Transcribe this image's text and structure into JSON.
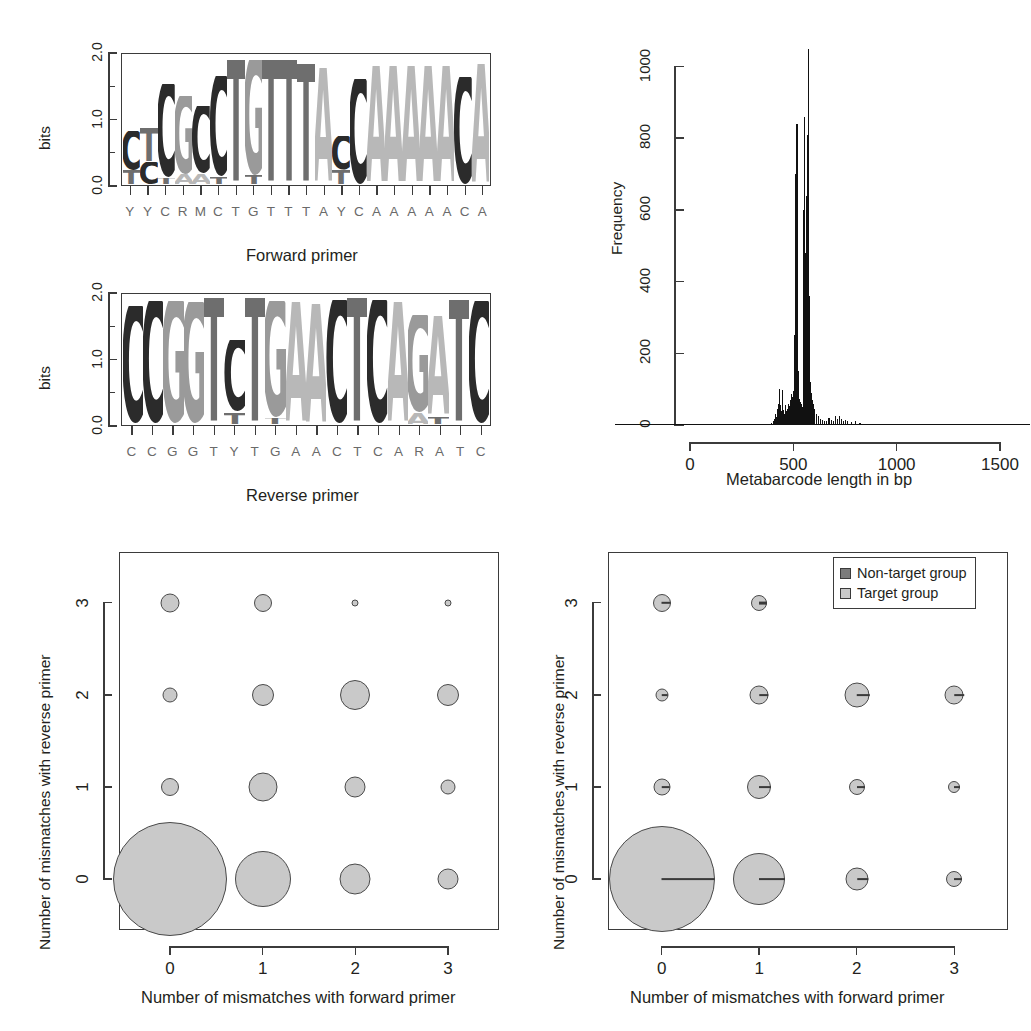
{
  "figure": {
    "background": "#ffffff",
    "colors": {
      "axis": "#3b3b3b",
      "text": "#231f20",
      "seq_label": "#6a6a6a",
      "hist_bar": "#111111",
      "target_fill": "#c9c9c9",
      "target_stroke": "#4a4a4a",
      "nontarget_fill": "#7b7b7b",
      "nontarget_stroke": "#3a3a3a",
      "base_A": "#b8b8b8",
      "base_C": "#2b2b2b",
      "base_G": "#9a9a9a",
      "base_T": "#6e6e6e"
    }
  },
  "chart_data": [
    {
      "id": "forward-primer-logo",
      "type": "bar",
      "title": "Forward primer",
      "xlabel": "",
      "ylabel": "bits",
      "ylim": [
        0,
        2
      ],
      "yticks": [
        "0.0",
        "1.0",
        "2.0"
      ],
      "grid": false,
      "consensus": [
        "Y",
        "Y",
        "C",
        "R",
        "M",
        "C",
        "T",
        "G",
        "T",
        "T",
        "T",
        "A",
        "Y",
        "C",
        "A",
        "A",
        "A",
        "A",
        "A",
        "C",
        "A"
      ],
      "categories": [
        "1",
        "2",
        "3",
        "4",
        "5",
        "6",
        "7",
        "8",
        "9",
        "10",
        "11",
        "12",
        "13",
        "14",
        "15",
        "16",
        "17",
        "18",
        "19",
        "20",
        "21"
      ],
      "stacks": [
        [
          {
            "base": "T",
            "bits": 0.22
          },
          {
            "base": "C",
            "bits": 0.6
          }
        ],
        [
          {
            "base": "C",
            "bits": 0.35
          },
          {
            "base": "T",
            "bits": 0.52
          }
        ],
        [
          {
            "base": "T",
            "bits": 0.1
          },
          {
            "base": "C",
            "bits": 1.45
          }
        ],
        [
          {
            "base": "A",
            "bits": 0.16
          },
          {
            "base": "G",
            "bits": 1.2
          }
        ],
        [
          {
            "base": "A",
            "bits": 0.16
          },
          {
            "base": "C",
            "bits": 1.05
          }
        ],
        [
          {
            "base": "T",
            "bits": 0.12
          },
          {
            "base": "C",
            "bits": 1.55
          }
        ],
        [
          {
            "base": "T",
            "bits": 1.92
          }
        ],
        [
          {
            "base": "T",
            "bits": 0.14
          },
          {
            "base": "G",
            "bits": 1.78
          }
        ],
        [
          {
            "base": "T",
            "bits": 1.92
          }
        ],
        [
          {
            "base": "T",
            "bits": 1.92
          }
        ],
        [
          {
            "base": "T",
            "bits": 1.86
          }
        ],
        [
          {
            "base": "A",
            "bits": 1.8
          }
        ],
        [
          {
            "base": "T",
            "bits": 0.22
          },
          {
            "base": "C",
            "bits": 0.52
          }
        ],
        [
          {
            "base": "C",
            "bits": 1.62
          }
        ],
        [
          {
            "base": "A",
            "bits": 1.82
          }
        ],
        [
          {
            "base": "A",
            "bits": 1.82
          }
        ],
        [
          {
            "base": "A",
            "bits": 1.82
          }
        ],
        [
          {
            "base": "A",
            "bits": 1.82
          }
        ],
        [
          {
            "base": "A",
            "bits": 1.82
          }
        ],
        [
          {
            "base": "C",
            "bits": 1.66
          }
        ],
        [
          {
            "base": "A",
            "bits": 1.86
          }
        ]
      ]
    },
    {
      "id": "reverse-primer-logo",
      "type": "bar",
      "title": "Reverse primer",
      "xlabel": "",
      "ylabel": "bits",
      "ylim": [
        0,
        2
      ],
      "yticks": [
        "0.0",
        "1.0",
        "2.0"
      ],
      "grid": false,
      "consensus": [
        "C",
        "C",
        "G",
        "G",
        "T",
        "Y",
        "T",
        "G",
        "A",
        "A",
        "C",
        "T",
        "C",
        "A",
        "R",
        "A",
        "T",
        "C"
      ],
      "categories": [
        "1",
        "2",
        "3",
        "4",
        "5",
        "6",
        "7",
        "8",
        "9",
        "10",
        "11",
        "12",
        "13",
        "14",
        "15",
        "16",
        "17",
        "18"
      ],
      "stacks": [
        [
          {
            "base": "C",
            "bits": 1.82
          }
        ],
        [
          {
            "base": "C",
            "bits": 1.9
          }
        ],
        [
          {
            "base": "G",
            "bits": 1.9
          }
        ],
        [
          {
            "base": "G",
            "bits": 1.88
          }
        ],
        [
          {
            "base": "T",
            "bits": 1.95
          }
        ],
        [
          {
            "base": "T",
            "bits": 0.18
          },
          {
            "base": "C",
            "bits": 1.12
          }
        ],
        [
          {
            "base": "T",
            "bits": 1.95
          }
        ],
        [
          {
            "base": "T",
            "bits": 0.1
          },
          {
            "base": "G",
            "bits": 1.8
          }
        ],
        [
          {
            "base": "A",
            "bits": 1.88
          }
        ],
        [
          {
            "base": "A",
            "bits": 1.86
          }
        ],
        [
          {
            "base": "C",
            "bits": 1.92
          }
        ],
        [
          {
            "base": "T",
            "bits": 1.95
          }
        ],
        [
          {
            "base": "C",
            "bits": 1.92
          }
        ],
        [
          {
            "base": "A",
            "bits": 1.88
          }
        ],
        [
          {
            "base": "A",
            "bits": 0.18
          },
          {
            "base": "G",
            "bits": 1.5
          }
        ],
        [
          {
            "base": "T",
            "bits": 0.12
          },
          {
            "base": "A",
            "bits": 1.55
          }
        ],
        [
          {
            "base": "T",
            "bits": 1.92
          }
        ],
        [
          {
            "base": "C",
            "bits": 1.9
          }
        ]
      ]
    },
    {
      "id": "metabarcode-length-histogram",
      "type": "bar",
      "title": "",
      "xlabel": "Metabarcode length in bp",
      "ylabel": "Frequency",
      "xlim": [
        0,
        1500
      ],
      "ylim": [
        0,
        1060
      ],
      "xticks": [
        "0",
        "500",
        "1000",
        "1500"
      ],
      "yticks": [
        "0",
        "200",
        "400",
        "600",
        "800",
        "1000"
      ],
      "grid": false,
      "bin_width_bp": 5,
      "bins": [
        {
          "bp": 300,
          "count": 2
        },
        {
          "bp": 320,
          "count": 2
        },
        {
          "bp": 345,
          "count": 3
        },
        {
          "bp": 360,
          "count": 2
        },
        {
          "bp": 375,
          "count": 4
        },
        {
          "bp": 390,
          "count": 6
        },
        {
          "bp": 400,
          "count": 12
        },
        {
          "bp": 405,
          "count": 18
        },
        {
          "bp": 410,
          "count": 30
        },
        {
          "bp": 415,
          "count": 22
        },
        {
          "bp": 420,
          "count": 45
        },
        {
          "bp": 425,
          "count": 60
        },
        {
          "bp": 430,
          "count": 100
        },
        {
          "bp": 435,
          "count": 55
        },
        {
          "bp": 440,
          "count": 38
        },
        {
          "bp": 445,
          "count": 98
        },
        {
          "bp": 450,
          "count": 42
        },
        {
          "bp": 455,
          "count": 30
        },
        {
          "bp": 460,
          "count": 55
        },
        {
          "bp": 465,
          "count": 38
        },
        {
          "bp": 470,
          "count": 46
        },
        {
          "bp": 475,
          "count": 60
        },
        {
          "bp": 480,
          "count": 52
        },
        {
          "bp": 485,
          "count": 70
        },
        {
          "bp": 490,
          "count": 86
        },
        {
          "bp": 495,
          "count": 78
        },
        {
          "bp": 500,
          "count": 96
        },
        {
          "bp": 505,
          "count": 250
        },
        {
          "bp": 510,
          "count": 700
        },
        {
          "bp": 515,
          "count": 840
        },
        {
          "bp": 520,
          "count": 150
        },
        {
          "bp": 525,
          "count": 72
        },
        {
          "bp": 530,
          "count": 64
        },
        {
          "bp": 535,
          "count": 58
        },
        {
          "bp": 540,
          "count": 50
        },
        {
          "bp": 545,
          "count": 600
        },
        {
          "bp": 550,
          "count": 860
        },
        {
          "bp": 555,
          "count": 480
        },
        {
          "bp": 560,
          "count": 640
        },
        {
          "bp": 565,
          "count": 810
        },
        {
          "bp": 570,
          "count": 1050
        },
        {
          "bp": 575,
          "count": 360
        },
        {
          "bp": 580,
          "count": 120
        },
        {
          "bp": 585,
          "count": 90
        },
        {
          "bp": 590,
          "count": 70
        },
        {
          "bp": 595,
          "count": 58
        },
        {
          "bp": 600,
          "count": 44
        },
        {
          "bp": 610,
          "count": 32
        },
        {
          "bp": 620,
          "count": 24
        },
        {
          "bp": 630,
          "count": 18
        },
        {
          "bp": 640,
          "count": 14
        },
        {
          "bp": 650,
          "count": 12
        },
        {
          "bp": 660,
          "count": 10
        },
        {
          "bp": 670,
          "count": 20
        },
        {
          "bp": 680,
          "count": 14
        },
        {
          "bp": 690,
          "count": 10
        },
        {
          "bp": 700,
          "count": 24
        },
        {
          "bp": 710,
          "count": 18
        },
        {
          "bp": 720,
          "count": 26
        },
        {
          "bp": 730,
          "count": 16
        },
        {
          "bp": 740,
          "count": 12
        },
        {
          "bp": 750,
          "count": 14
        },
        {
          "bp": 760,
          "count": 10
        },
        {
          "bp": 780,
          "count": 8
        },
        {
          "bp": 800,
          "count": 10
        },
        {
          "bp": 820,
          "count": 6
        },
        {
          "bp": 850,
          "count": 4
        },
        {
          "bp": 880,
          "count": 3
        },
        {
          "bp": 920,
          "count": 3
        },
        {
          "bp": 970,
          "count": 2
        },
        {
          "bp": 1020,
          "count": 2
        },
        {
          "bp": 1080,
          "count": 2
        },
        {
          "bp": 1150,
          "count": 2
        },
        {
          "bp": 1250,
          "count": 2
        },
        {
          "bp": 1350,
          "count": 3
        },
        {
          "bp": 1430,
          "count": 2
        }
      ]
    },
    {
      "id": "mismatch-bubble-left",
      "type": "scatter",
      "title": "",
      "xlabel": "Number of mismatches with forward primer",
      "ylabel": "Number of mismatches with reverse primer",
      "xticks": [
        "0",
        "1",
        "2",
        "3"
      ],
      "yticks": [
        "0",
        "1",
        "2",
        "3"
      ],
      "xlim": [
        -0.55,
        3.55
      ],
      "ylim": [
        -0.55,
        3.55
      ],
      "grid": false,
      "legend": null,
      "series": [
        {
          "name": "Target group",
          "points": [
            {
              "x": 0,
              "y": 0,
              "r": 57.0
            },
            {
              "x": 1,
              "y": 0,
              "r": 28.0
            },
            {
              "x": 2,
              "y": 0,
              "r": 15.5
            },
            {
              "x": 3,
              "y": 0,
              "r": 10.5
            },
            {
              "x": 0,
              "y": 1,
              "r": 9.0
            },
            {
              "x": 1,
              "y": 1,
              "r": 14.5
            },
            {
              "x": 2,
              "y": 1,
              "r": 10.5
            },
            {
              "x": 3,
              "y": 1,
              "r": 7.5
            },
            {
              "x": 0,
              "y": 2,
              "r": 7.5
            },
            {
              "x": 1,
              "y": 2,
              "r": 11.0
            },
            {
              "x": 2,
              "y": 2,
              "r": 15.0
            },
            {
              "x": 3,
              "y": 2,
              "r": 11.0
            },
            {
              "x": 0,
              "y": 3,
              "r": 9.5
            },
            {
              "x": 1,
              "y": 3,
              "r": 9.0
            },
            {
              "x": 2,
              "y": 3,
              "r": 3.5
            },
            {
              "x": 3,
              "y": 3,
              "r": 3.5
            }
          ]
        }
      ]
    },
    {
      "id": "mismatch-bubble-right",
      "type": "scatter",
      "title": "",
      "xlabel": "Number of mismatches with forward primer",
      "ylabel": "Number of mismatches with reverse primer",
      "xticks": [
        "0",
        "1",
        "2",
        "3"
      ],
      "yticks": [
        "0",
        "1",
        "2",
        "3"
      ],
      "xlim": [
        -0.55,
        3.55
      ],
      "ylim": [
        -0.55,
        3.55
      ],
      "grid": false,
      "legend": {
        "position": "top-right",
        "entries": [
          {
            "label": "Non-target group",
            "color": "#7b7b7b"
          },
          {
            "label": "Target group",
            "color": "#c9c9c9"
          }
        ]
      },
      "series": [
        {
          "name": "Target group",
          "points": [
            {
              "x": 0,
              "y": 0,
              "r": 53.0
            },
            {
              "x": 1,
              "y": 0,
              "r": 26.0
            },
            {
              "x": 2,
              "y": 0,
              "r": 11.5
            },
            {
              "x": 3,
              "y": 0,
              "r": 8.0
            },
            {
              "x": 0,
              "y": 1,
              "r": 8.5
            },
            {
              "x": 1,
              "y": 1,
              "r": 12.0
            },
            {
              "x": 2,
              "y": 1,
              "r": 8.0
            },
            {
              "x": 3,
              "y": 1,
              "r": 6.0
            },
            {
              "x": 0,
              "y": 2,
              "r": 6.5
            },
            {
              "x": 1,
              "y": 2,
              "r": 9.5
            },
            {
              "x": 2,
              "y": 2,
              "r": 12.5
            },
            {
              "x": 3,
              "y": 2,
              "r": 9.5
            },
            {
              "x": 0,
              "y": 3,
              "r": 9.0
            },
            {
              "x": 1,
              "y": 3,
              "r": 8.0
            },
            {
              "x": 2,
              "y": 3,
              "r": 6.0
            },
            {
              "x": 3,
              "y": 3,
              "r": 5.5
            }
          ]
        },
        {
          "name": "Non-target group",
          "points": [
            {
              "x": 0,
              "y": 0,
              "rx": 53.0,
              "ry": 0.9
            },
            {
              "x": 1,
              "y": 0,
              "rx": 26.0,
              "ry": 0.9
            },
            {
              "x": 2,
              "y": 0,
              "rx": 11.5,
              "ry": 0.9
            },
            {
              "x": 3,
              "y": 0,
              "rx": 8.0,
              "ry": 0.9
            },
            {
              "x": 0,
              "y": 1,
              "rx": 8.5,
              "ry": 0.9
            },
            {
              "x": 1,
              "y": 1,
              "rx": 12.0,
              "ry": 0.9
            },
            {
              "x": 2,
              "y": 1,
              "rx": 8.0,
              "ry": 0.9
            },
            {
              "x": 3,
              "y": 1,
              "rx": 6.0,
              "ry": 0.9
            },
            {
              "x": 0,
              "y": 2,
              "rx": 6.5,
              "ry": 0.9
            },
            {
              "x": 1,
              "y": 2,
              "rx": 9.5,
              "ry": 0.9
            },
            {
              "x": 2,
              "y": 2,
              "rx": 12.5,
              "ry": 0.9
            },
            {
              "x": 3,
              "y": 2,
              "rx": 9.5,
              "ry": 0.9
            },
            {
              "x": 0,
              "y": 3,
              "rx": 9.0,
              "ry": 1.2
            },
            {
              "x": 1,
              "y": 3,
              "rx": 8.0,
              "ry": 1.4
            },
            {
              "x": 2,
              "y": 3,
              "rx": 6.0,
              "ry": 4.2
            },
            {
              "x": 3,
              "y": 3,
              "rx": 5.5,
              "ry": 2.6
            }
          ]
        }
      ]
    }
  ],
  "panels": {
    "forward": {
      "caption": "Forward primer",
      "ylabel": "bits"
    },
    "reverse": {
      "caption": "Reverse primer",
      "ylabel": "bits"
    },
    "histogram": {
      "xlabel": "Metabarcode length in bp",
      "ylabel": "Frequency"
    },
    "bubble_left": {
      "xlabel": "Number of mismatches with forward primer",
      "ylabel": "Number of mismatches with reverse primer"
    },
    "bubble_right": {
      "xlabel": "Number of mismatches with forward primer",
      "ylabel": "Number of mismatches with reverse primer",
      "legend_nontarget": "Non-target group",
      "legend_target": "Target group"
    }
  }
}
